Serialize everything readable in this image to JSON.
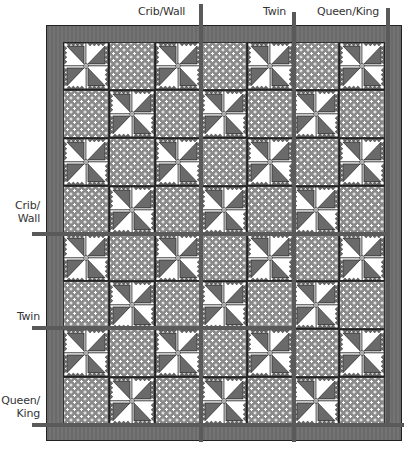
{
  "diagram": {
    "grid": {
      "columns": 7,
      "rows": 8,
      "pattern": "alternating pinwheel and polka-dot blocks; pinwheel where (row+col) is even"
    },
    "colors": {
      "border": "#6e6e6e",
      "dot_fabric": "#8a8a8a",
      "dot": "#ffffff",
      "triangle_dark": "#6a6a6a",
      "triangle_light": "#ffffff",
      "size_marker": "#5a5a5a"
    },
    "top_labels": [
      {
        "text": "Crib/Wall",
        "marker": "vertical-line"
      },
      {
        "text": "Twin",
        "marker": "vertical-line"
      },
      {
        "text": "Queen/King",
        "marker": "vertical-line"
      }
    ],
    "side_labels": [
      {
        "line1": "Crib/",
        "line2": "Wall",
        "marker": "horizontal-line"
      },
      {
        "line1": "Twin",
        "line2": "",
        "marker": "horizontal-line"
      },
      {
        "line1": "Queen/",
        "line2": "King",
        "marker": "horizontal-line"
      }
    ]
  }
}
